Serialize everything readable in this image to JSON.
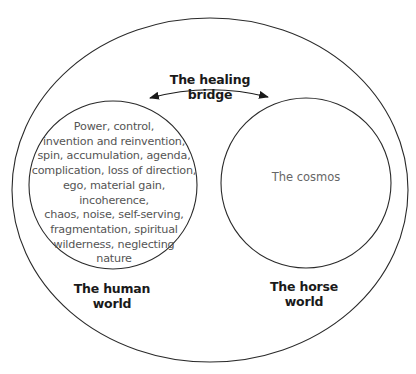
{
  "diagram": {
    "outer_circle": {
      "label": ""
    },
    "bridge": {
      "label": "The healing bridge",
      "arrow": "double-headed-arrow"
    },
    "human_world": {
      "label_line1": "The human",
      "label_line2": "world",
      "contents": [
        "Power, control,",
        "invention and reinvention,",
        "spin, accumulation, agenda,",
        "complication, loss of direction,",
        "ego, material gain, incoherence,",
        "chaos, noise, self-serving,",
        "fragmentation, spiritual",
        "wilderness, neglecting",
        "nature"
      ]
    },
    "horse_world": {
      "label_line1": "The horse",
      "label_line2": "world",
      "contents": "The cosmos"
    },
    "colors": {
      "stroke": "#2a2a2a",
      "text_dark": "#1a1a1a",
      "text_light": "#555555"
    }
  }
}
